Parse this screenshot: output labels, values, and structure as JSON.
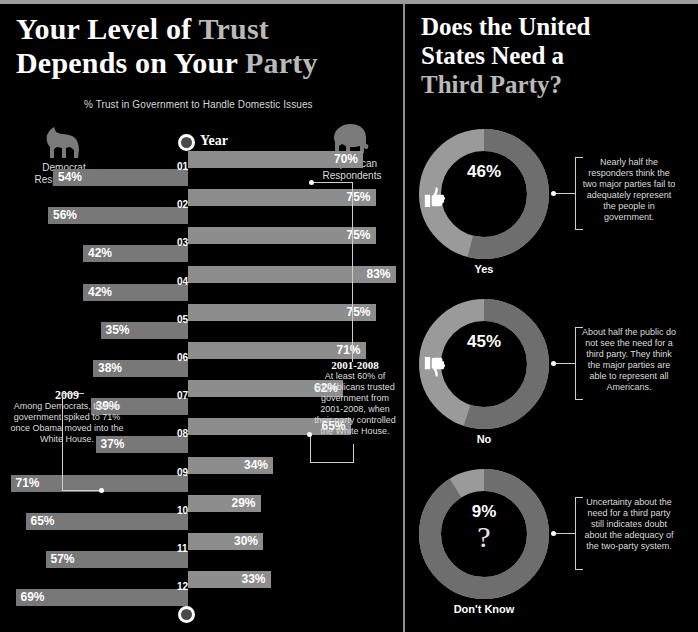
{
  "left_panel": {
    "title_line1_a": "Your Level of ",
    "title_line1_b": "Trust",
    "title_line2_a": "Depends on Your ",
    "title_line2_b": "Party",
    "subtitle": "% Trust in Government to Handle Domestic Issues",
    "year_label": "Year",
    "legend": {
      "democrat": "Democrat\nRespondents",
      "democrat_line1": "Democrat",
      "democrat_line2": "Respondents",
      "republican_line1": "Republican",
      "republican_line2": "Respondents",
      "democrat_icon": "donkey-icon",
      "republican_icon": "elephant-icon"
    },
    "callout_left": {
      "heading": "2009",
      "body": "Among Democrats, trust in government spiked to 71% once Obama moved into the White House."
    },
    "callout_right": {
      "heading": "2001-2008",
      "body": "At least 60% of Republicans trusted government from 2001-2008, when their party controlled the White House."
    }
  },
  "right_panel": {
    "title_line1": "Does the United",
    "title_line2": "States Need a",
    "title_line3": "Third Party?",
    "donuts": [
      {
        "label": "Yes",
        "percent": "46%",
        "value": 46,
        "icon": "thumbs-up-icon",
        "note": "Nearly half the responders think the two major parties fail to adequately represent the people in government."
      },
      {
        "label": "No",
        "percent": "45%",
        "value": 45,
        "icon": "thumbs-down-icon",
        "note": "About half the public do not see the need for a third party. They think the major parties are able to represent all Americans."
      },
      {
        "label": "Don't Know",
        "percent": "9%",
        "value": 9,
        "icon": "question-mark-icon",
        "note": "Uncertainty about the need for a third party still indicates doubt about the adequacy of the two-party system."
      }
    ]
  },
  "colors": {
    "background": "#000000",
    "republican_bar": "#8d8d8d",
    "democrat_bar": "#787878",
    "donut_major": "#9a9a9a",
    "donut_minor": "#6e6e6e",
    "rule": "#9d9d9d",
    "title_accent": "#b9b9b9"
  },
  "chart_data": {
    "type": "bar",
    "title": "% Trust in Government to Handle Domestic Issues",
    "orientation": "horizontal-diverging",
    "xlabel": "",
    "ylabel": "Year",
    "categories": [
      "01",
      "02",
      "03",
      "04",
      "05",
      "06",
      "07",
      "08",
      "09",
      "10",
      "11",
      "12"
    ],
    "series": [
      {
        "name": "Republican Respondents",
        "values": [
          70,
          75,
          75,
          83,
          75,
          71,
          62,
          65,
          34,
          29,
          30,
          33
        ],
        "labels": [
          "70%",
          "75%",
          "75%",
          "83%",
          "75%",
          "71%",
          "62%",
          "65%",
          "34%",
          "29%",
          "30%",
          "33%"
        ],
        "direction": "right",
        "color": "#8d8d8d"
      },
      {
        "name": "Democrat Respondents",
        "values": [
          54,
          56,
          42,
          42,
          35,
          38,
          39,
          37,
          71,
          65,
          57,
          69
        ],
        "labels": [
          "54%",
          "56%",
          "42%",
          "42%",
          "35%",
          "38%",
          "39%",
          "37%",
          "71%",
          "65%",
          "57%",
          "69%"
        ],
        "direction": "left",
        "color": "#787878"
      }
    ],
    "xlim": [
      0,
      100
    ],
    "grid": false,
    "legend_position": "top"
  },
  "donut_chart_data": {
    "type": "pie",
    "title": "Does the United States Need a Third Party?",
    "categories": [
      "Yes",
      "No",
      "Don't Know"
    ],
    "values": [
      46,
      45,
      9
    ],
    "labels": [
      "46%",
      "45%",
      "9%"
    ]
  }
}
